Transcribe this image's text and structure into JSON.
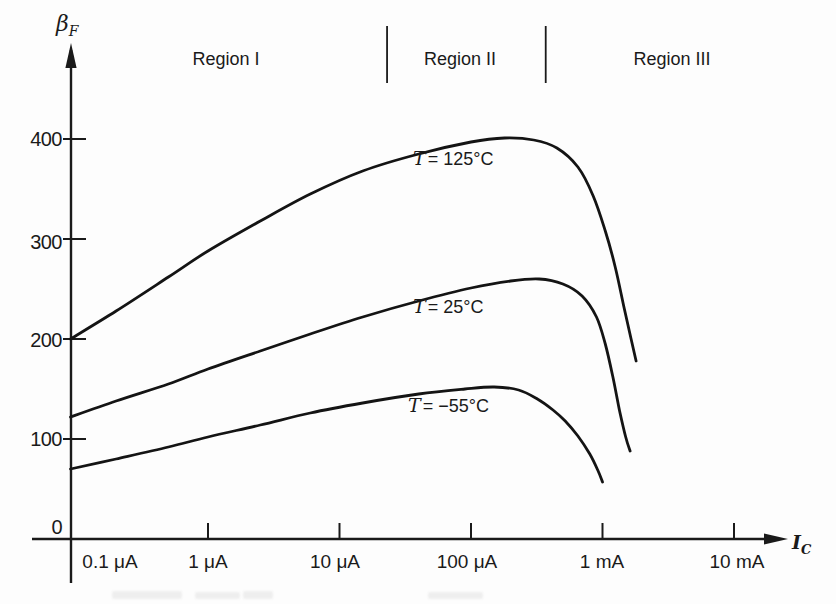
{
  "chart_data": {
    "type": "line",
    "title": "",
    "xlabel": "I_C",
    "ylabel": "beta_F",
    "x_scale": "log",
    "grid": false,
    "legend_position": "inline-curve-labels",
    "ylim": [
      0,
      450
    ],
    "x_ticks": [
      {
        "uA": 0.1,
        "label": "0.1 μA",
        "tick": false
      },
      {
        "uA": 1,
        "label": "1 μA",
        "tick": true
      },
      {
        "uA": 10,
        "label": "10 μA",
        "tick": true
      },
      {
        "uA": 100,
        "label": "100 μA",
        "tick": true
      },
      {
        "uA": 1000,
        "label": "1 mA",
        "tick": true
      },
      {
        "uA": 10000,
        "label": "10 mA",
        "tick": true
      }
    ],
    "y_ticks": [
      {
        "value": 0,
        "label": "0",
        "tick": false
      },
      {
        "value": 100,
        "label": "100",
        "tick": true
      },
      {
        "value": 200,
        "label": "200",
        "tick": true
      },
      {
        "value": 300,
        "label": "300",
        "tick": true
      },
      {
        "value": 400,
        "label": "400",
        "tick": true
      }
    ],
    "regions": [
      {
        "label": "Region I"
      },
      {
        "label": "Region II"
      },
      {
        "label": "Region III"
      }
    ],
    "region_boundaries_uA": [
      23,
      370
    ],
    "series": [
      {
        "name": "T = 125°C",
        "label_var": "T",
        "label_rest": "= 125°C",
        "points_uA_beta": [
          [
            0.09,
            200
          ],
          [
            0.2,
            228
          ],
          [
            0.5,
            262
          ],
          [
            1,
            288
          ],
          [
            2.5,
            318
          ],
          [
            6,
            345
          ],
          [
            15,
            368
          ],
          [
            40,
            385
          ],
          [
            100,
            397
          ],
          [
            180,
            401
          ],
          [
            300,
            399
          ],
          [
            450,
            391
          ],
          [
            650,
            372
          ],
          [
            850,
            343
          ],
          [
            1050,
            308
          ],
          [
            1250,
            272
          ],
          [
            1450,
            233
          ],
          [
            1650,
            200
          ],
          [
            1800,
            178
          ]
        ]
      },
      {
        "name": "T = 25°C",
        "label_var": "T",
        "label_rest": "= 25°C",
        "points_uA_beta": [
          [
            0.09,
            122
          ],
          [
            0.2,
            138
          ],
          [
            0.5,
            155
          ],
          [
            1,
            170
          ],
          [
            2.5,
            188
          ],
          [
            6,
            205
          ],
          [
            15,
            222
          ],
          [
            40,
            238
          ],
          [
            100,
            251
          ],
          [
            200,
            258
          ],
          [
            330,
            260
          ],
          [
            500,
            255
          ],
          [
            700,
            243
          ],
          [
            900,
            222
          ],
          [
            1050,
            195
          ],
          [
            1200,
            162
          ],
          [
            1350,
            128
          ],
          [
            1500,
            102
          ],
          [
            1620,
            88
          ]
        ]
      },
      {
        "name": "T = −55°C",
        "label_var": "T",
        "label_rest": "= −55°C",
        "points_uA_beta": [
          [
            0.09,
            70
          ],
          [
            0.2,
            80
          ],
          [
            0.5,
            92
          ],
          [
            1,
            102
          ],
          [
            2.5,
            114
          ],
          [
            6,
            126
          ],
          [
            15,
            136
          ],
          [
            40,
            145
          ],
          [
            90,
            150
          ],
          [
            150,
            152
          ],
          [
            230,
            149
          ],
          [
            320,
            140
          ],
          [
            420,
            129
          ],
          [
            520,
            118
          ],
          [
            650,
            103
          ],
          [
            800,
            85
          ],
          [
            920,
            69
          ],
          [
            1000,
            57
          ]
        ]
      }
    ]
  },
  "labels": {
    "y_axis": {
      "symbol": "β",
      "sub": "F"
    },
    "x_axis": {
      "symbol": "I",
      "sub": "C"
    }
  }
}
